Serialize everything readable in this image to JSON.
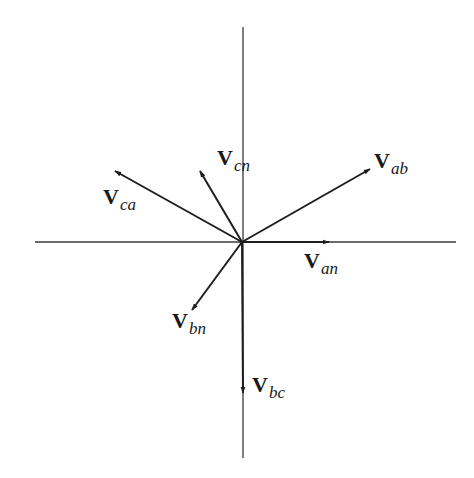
{
  "diagram": {
    "type": "phasor-diagram",
    "origin": [
      242,
      242
    ],
    "axes": {
      "horizontal": {
        "x1": 35,
        "x2": 456,
        "y": 242
      },
      "vertical": {
        "x": 243,
        "y1": 27,
        "y2": 458
      }
    },
    "vectors": [
      {
        "id": "van",
        "symbol": "V",
        "subscript": "an",
        "tip": [
          329,
          242
        ],
        "label_pos": [
          304,
          250
        ]
      },
      {
        "id": "vab",
        "symbol": "V",
        "subscript": "ab",
        "tip": [
          370,
          169
        ],
        "label_pos": [
          374,
          150
        ]
      },
      {
        "id": "vca",
        "symbol": "V",
        "subscript": "ca",
        "tip": [
          115,
          171
        ],
        "label_pos": [
          103,
          186
        ]
      },
      {
        "id": "vcn",
        "symbol": "V",
        "subscript": "cn",
        "tip": [
          200,
          171
        ],
        "label_pos": [
          217,
          147
        ]
      },
      {
        "id": "vbn",
        "symbol": "V",
        "subscript": "bn",
        "tip": [
          192,
          310
        ],
        "label_pos": [
          172,
          310
        ]
      },
      {
        "id": "vbc",
        "symbol": "V",
        "subscript": "bc",
        "tip": [
          243,
          393
        ],
        "label_pos": [
          252,
          374
        ]
      }
    ],
    "colors": {
      "axis": "#3a3a3a",
      "vector": "#1e1e1e",
      "text": "#1a1a1a",
      "background": "#ffffff"
    }
  }
}
